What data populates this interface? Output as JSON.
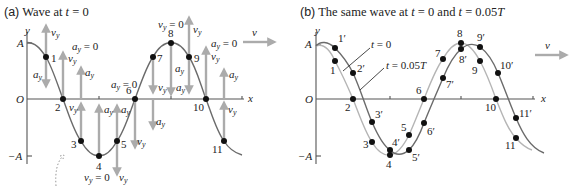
{
  "panel_a": {
    "title_prefix": "(a)",
    "title_text": "Wave at t = 0",
    "axis": {
      "y": "y",
      "x": "x",
      "origin": "O",
      "amp_pos": "A",
      "amp_neg": "−A"
    },
    "wave_velocity_label": "v",
    "points": [
      {
        "label": "1",
        "x": 46,
        "y": 57
      },
      {
        "label": "2",
        "x": 63,
        "y": 99
      },
      {
        "label": "3",
        "x": 81,
        "y": 141
      },
      {
        "label": "4",
        "x": 99,
        "y": 156
      },
      {
        "label": "5",
        "x": 117,
        "y": 141
      },
      {
        "label": "6",
        "x": 135,
        "y": 99
      },
      {
        "label": "7",
        "x": 153,
        "y": 57
      },
      {
        "label": "8",
        "x": 171,
        "y": 43
      },
      {
        "label": "9",
        "x": 189,
        "y": 57
      },
      {
        "label": "10",
        "x": 206,
        "y": 99
      },
      {
        "label": "11",
        "x": 224,
        "y": 141
      }
    ],
    "annotations": {
      "vy": "v",
      "ay": "a",
      "sub_y": "y",
      "vy_zero": "= 0",
      "ay_zero": "= 0"
    }
  },
  "panel_b": {
    "title_prefix": "(b)",
    "title_text": "The same wave at t = 0 and t = 0.05T",
    "axis": {
      "y": "y",
      "x": "x",
      "origin": "O",
      "amp_pos": "A",
      "amp_neg": "−A"
    },
    "wave_velocity_label": "v",
    "legend": {
      "t0": "t = 0",
      "t1": "t = 0.05T"
    },
    "points_t0": [
      {
        "label": "1",
        "x": 335,
        "y": 61
      },
      {
        "label": "2",
        "x": 353,
        "y": 99
      },
      {
        "label": "3",
        "x": 372,
        "y": 142
      },
      {
        "label": "4",
        "x": 390,
        "y": 155
      },
      {
        "label": "5",
        "x": 409,
        "y": 135
      },
      {
        "label": "6",
        "x": 424,
        "y": 99
      },
      {
        "label": "7",
        "x": 443,
        "y": 59
      },
      {
        "label": "8",
        "x": 461,
        "y": 43
      },
      {
        "label": "9",
        "x": 480,
        "y": 61
      },
      {
        "label": "10",
        "x": 496,
        "y": 99
      },
      {
        "label": "11",
        "x": 516,
        "y": 138
      }
    ],
    "points_t1": [
      {
        "label": "1′",
        "x": 335,
        "y": 48
      },
      {
        "label": "2′",
        "x": 353,
        "y": 73
      },
      {
        "label": "3′",
        "x": 372,
        "y": 122
      },
      {
        "label": "4′",
        "x": 390,
        "y": 150
      },
      {
        "label": "5′",
        "x": 409,
        "y": 150
      },
      {
        "label": "6′",
        "x": 424,
        "y": 123
      },
      {
        "label": "7′",
        "x": 443,
        "y": 78
      },
      {
        "label": "8′",
        "x": 461,
        "y": 49
      },
      {
        "label": "9′",
        "x": 480,
        "y": 47
      },
      {
        "label": "10′",
        "x": 498,
        "y": 73
      },
      {
        "label": "11′",
        "x": 516,
        "y": 118
      }
    ]
  },
  "colors": {
    "curve_dark": "#6b6b6b",
    "curve_light": "#b5b5b5",
    "arrow": "#ababab",
    "dot": "#111111",
    "text": "#222222"
  }
}
